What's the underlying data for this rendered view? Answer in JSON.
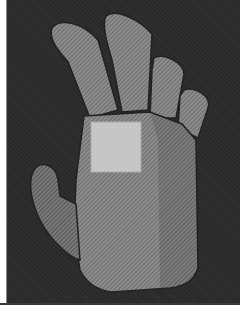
{
  "scene": {
    "subject": "3D hand mesh",
    "background_color": "#2a2a2a",
    "mesh_color": "#8a8a8a",
    "patch_color": "#c8c8c8",
    "frame_color": "#ffffff"
  }
}
